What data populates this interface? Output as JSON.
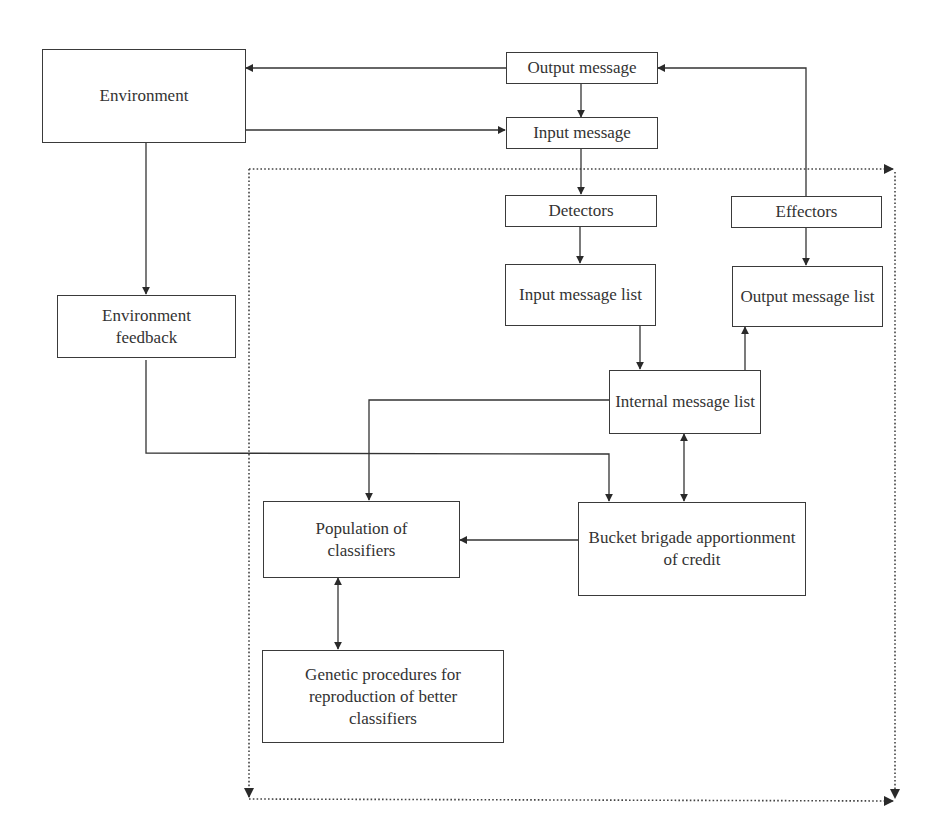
{
  "diagram": {
    "type": "flowchart",
    "nodes": {
      "environment": "Environment",
      "output_message": "Output message",
      "input_message": "Input message",
      "detectors": "Detectors",
      "effectors": "Effectors",
      "input_message_list": "Input message list",
      "output_message_list": "Output message list",
      "environment_feedback": "Environment feedback",
      "internal_message_list": "Internal message list",
      "population_of_classifiers": "Population of classifiers",
      "bucket_brigade": "Bucket brigade apportionment of credit",
      "genetic_procedures": "Genetic procedures for reproduction of better classifiers"
    },
    "edges": [
      {
        "from": "output_message",
        "to": "environment"
      },
      {
        "from": "output_message",
        "to": "input_message"
      },
      {
        "from": "environment",
        "to": "input_message"
      },
      {
        "from": "environment",
        "to": "environment_feedback"
      },
      {
        "from": "input_message",
        "to": "detectors"
      },
      {
        "from": "detectors",
        "to": "input_message_list"
      },
      {
        "from": "effectors",
        "to": "output_message"
      },
      {
        "from": "effectors",
        "to": "output_message_list"
      },
      {
        "from": "input_message_list",
        "to": "internal_message_list"
      },
      {
        "from": "internal_message_list",
        "to": "output_message_list"
      },
      {
        "from": "internal_message_list",
        "to": "population_of_classifiers"
      },
      {
        "from": "environment_feedback",
        "to": "bucket_brigade"
      },
      {
        "from": "internal_message_list",
        "to": "bucket_brigade",
        "bidirectional": true
      },
      {
        "from": "bucket_brigade",
        "to": "population_of_classifiers"
      },
      {
        "from": "population_of_classifiers",
        "to": "genetic_procedures",
        "bidirectional": true
      }
    ],
    "line_color": "#333333",
    "boundary_style": "dotted"
  }
}
